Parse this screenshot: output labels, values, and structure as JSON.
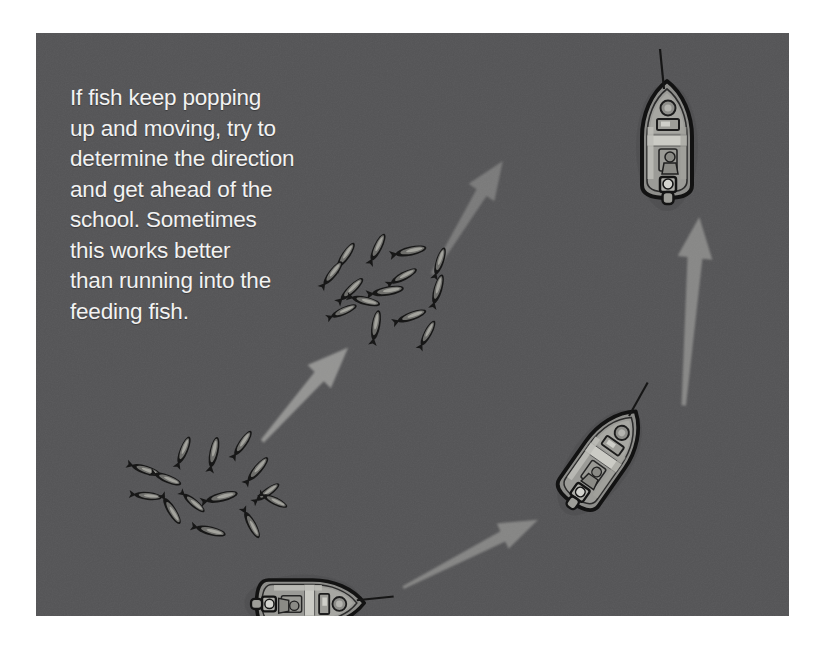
{
  "illustration": {
    "title": "Fishing boat intercepting a moving school of fish",
    "caption": "If fish keep popping\nup and moving, try to\ndetermine the direction\nand get ahead of the\nschool. Sometimes\nthis works better\nthan running into the\nfeeding fish.",
    "background_color": "#545456",
    "page_background_color": "#ffffff",
    "caption_color": "#f2f2f2",
    "arrow_color": "#82827f",
    "fish_color": "#1c1c1c",
    "boat_hull_color": "#8f8f8c",
    "boat_outline_color": "#141414",
    "boat_deck_color": "#b9b9b4"
  },
  "panel": {
    "x": 36,
    "y": 33,
    "width": 753,
    "height": 583
  },
  "boats": [
    {
      "id": "boat-bottom",
      "label": "Boat starting position",
      "cx": 273,
      "cy": 570,
      "rotation_deg": 90,
      "scale": 0.92
    },
    {
      "id": "boat-middle",
      "label": "Boat running ahead of the school",
      "cx": 567,
      "cy": 425,
      "rotation_deg": 35,
      "scale": 0.95
    },
    {
      "id": "boat-top",
      "label": "Boat ahead of the school",
      "cx": 631,
      "cy": 105,
      "rotation_deg": 0,
      "scale": 1.0
    }
  ],
  "fish_schools": [
    {
      "id": "school-lower",
      "label": "Earlier fish school position",
      "cx": 160,
      "cy": 452,
      "count": 14
    },
    {
      "id": "school-upper",
      "label": "Later fish school position",
      "cx": 355,
      "cy": 260,
      "count": 14
    }
  ],
  "arrows": [
    {
      "id": "arrow-boat-path-lower",
      "label": "Boat travel arrow from start toward middle boat",
      "x1": 365,
      "y1": 550,
      "x2": 516,
      "y2": 478,
      "opacity": 0.42
    },
    {
      "id": "arrow-boat-path-upper",
      "label": "Boat travel arrow from middle boat to ahead of the school",
      "x1": 645,
      "y1": 370,
      "x2": 656,
      "y2": 180,
      "opacity": 0.42
    },
    {
      "id": "arrow-school-movement-lower",
      "label": "School movement arrow from lower school to upper school",
      "x1": 225,
      "y1": 400,
      "x2": 325,
      "y2": 300,
      "opacity": 0.5
    },
    {
      "id": "arrow-school-movement-upper",
      "label": "School movement arrow continuing past the upper school",
      "x1": 400,
      "y1": 230,
      "x2": 480,
      "y2": 108,
      "opacity": 0.3
    }
  ]
}
